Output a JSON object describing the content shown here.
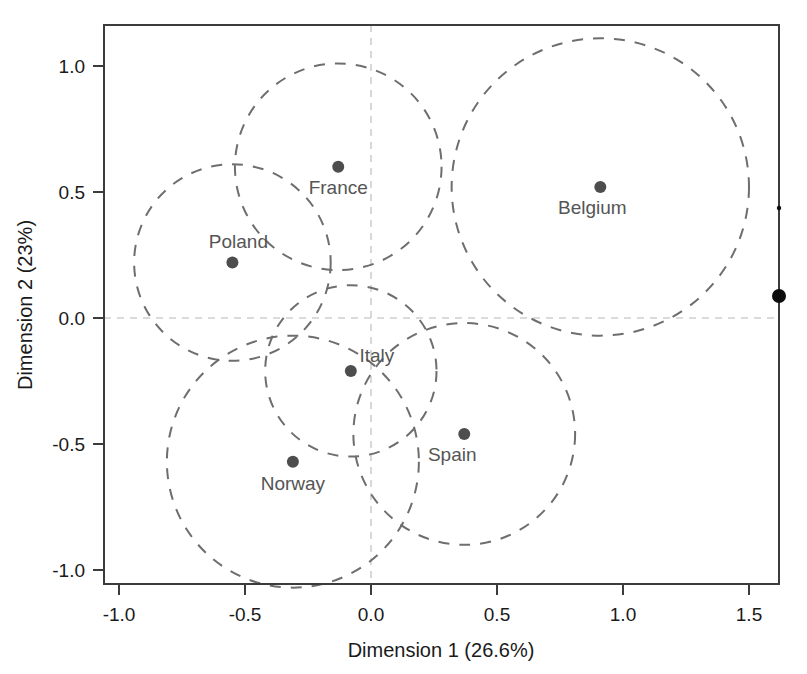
{
  "chart_data": {
    "type": "scatter",
    "title": "",
    "xlabel": "Dimension 1 (26.6%)",
    "ylabel": "Dimension 2 (23%)",
    "xlim": [
      -1.16,
      1.62
    ],
    "ylim": [
      -1.16,
      1.16
    ],
    "xticks": [
      -1.0,
      -0.5,
      0.0,
      0.5,
      1.0,
      1.5
    ],
    "yticks": [
      1.0,
      0.5,
      0.0,
      -0.5,
      -1.0
    ],
    "xtick_labels": [
      "-1.0",
      "-0.5",
      "0.0",
      "0.5",
      "1.0",
      "1.5"
    ],
    "ytick_labels": [
      "1.0",
      "0.5",
      "0.0",
      "-0.5",
      "-1.0"
    ],
    "grid": "zero-lines-only",
    "legend": "none",
    "point_color": "#4d4d4d",
    "ellipse_color": "#6e6e6e",
    "grid_color": "#cfcfcf",
    "points": [
      {
        "label": "France",
        "x": -0.13,
        "y": 0.6,
        "radius": 0.41,
        "label_dx": 0,
        "label_dy": 27,
        "label_anchor": "middle"
      },
      {
        "label": "Poland",
        "x": -0.55,
        "y": 0.22,
        "radius": 0.39,
        "label_dx": 6,
        "label_dy": -15,
        "label_anchor": "middle"
      },
      {
        "label": "Belgium",
        "x": 0.91,
        "y": 0.52,
        "radius": 0.59,
        "label_dx": -8,
        "label_dy": 27,
        "label_anchor": "middle"
      },
      {
        "label": "Italy",
        "x": -0.08,
        "y": -0.21,
        "radius": 0.34,
        "label_dx": 26,
        "label_dy": -9,
        "label_anchor": "middle"
      },
      {
        "label": "Norway",
        "x": -0.31,
        "y": -0.57,
        "radius": 0.5,
        "label_dx": 0,
        "label_dy": 28,
        "label_anchor": "middle"
      },
      {
        "label": "Spain",
        "x": 0.37,
        "y": -0.46,
        "radius": 0.44,
        "label_dx": -12,
        "label_dy": 27,
        "label_anchor": "middle"
      }
    ],
    "artifacts": [
      {
        "name": "edge-speck-small",
        "px": 779,
        "py": 208,
        "r": 2.2
      },
      {
        "name": "edge-speck-large",
        "px": 779,
        "py": 296,
        "r": 7.0
      }
    ]
  }
}
